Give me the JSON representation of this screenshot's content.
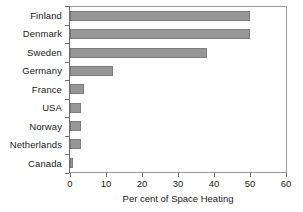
{
  "chart_data": {
    "type": "bar",
    "orientation": "horizontal",
    "title": "",
    "xlabel": "Per cent of Space Heating",
    "ylabel": "",
    "categories": [
      "Finland",
      "Denmark",
      "Sweden",
      "Germany",
      "France",
      "USA",
      "Norway",
      "Netherlands",
      "Canada"
    ],
    "values": [
      50,
      50,
      38,
      12,
      4,
      3,
      3,
      3,
      0.8
    ],
    "xlim": [
      0,
      60
    ],
    "xticks": [
      0,
      10,
      20,
      30,
      40,
      50,
      60
    ],
    "xtick_labels": [
      "0",
      "10",
      "20",
      "30",
      "40",
      "50",
      "60"
    ],
    "grid": false,
    "legend": false,
    "bar_color": "#969696",
    "bar_edge_color": "#7d7d7d",
    "axis_color": "#6e6e6e",
    "frame_color": "#9a9a9a"
  }
}
